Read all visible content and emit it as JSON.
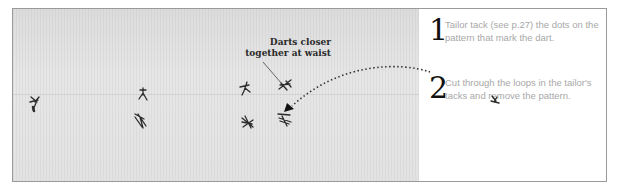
{
  "photo": {
    "annotation": "Darts closer together at waist",
    "annotation_lines": [
      "Darts closer",
      "together at waist"
    ],
    "tacks": [
      {
        "x": 35,
        "y": 103
      },
      {
        "x": 143,
        "y": 93
      },
      {
        "x": 140,
        "y": 120
      },
      {
        "x": 245,
        "y": 88
      },
      {
        "x": 285,
        "y": 85
      },
      {
        "x": 248,
        "y": 122
      },
      {
        "x": 285,
        "y": 118
      },
      {
        "x": 495,
        "y": 100
      }
    ]
  },
  "steps": [
    {
      "number": "1",
      "text": "Tailor tack (see p.27) the dots on the pattern that mark the dart."
    },
    {
      "number": "2",
      "text": "Cut through the loops in the tailor's tacks and remove the pattern."
    }
  ],
  "colors": {
    "step_number": "#111111",
    "step_text": "#a8a8a8",
    "fabric": "#e0e0e0",
    "border": "#9a9a9a"
  }
}
